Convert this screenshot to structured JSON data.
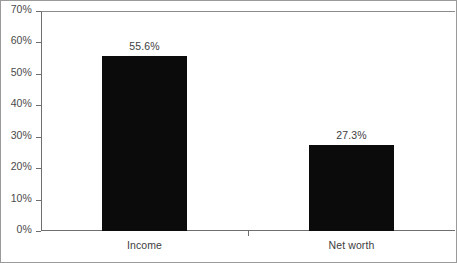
{
  "chart_data": {
    "type": "bar",
    "title": "",
    "subtitle": "",
    "xlabel": "",
    "ylabel": "",
    "categories": [
      "Income",
      "Net worth"
    ],
    "values": [
      55.6,
      27.3
    ],
    "value_labels": [
      "55.6%",
      "27.3%"
    ],
    "ylim": [
      0,
      70
    ],
    "yticks": [
      0,
      10,
      20,
      30,
      40,
      50,
      60,
      70
    ],
    "ytick_labels": [
      "0%",
      "10%",
      "20%",
      "30%",
      "40%",
      "50%",
      "60%",
      "70%"
    ],
    "grid": false,
    "legend": false,
    "legend_position": "none",
    "series": [
      {
        "name": "",
        "values": [
          55.6,
          27.3
        ],
        "color": "#0b0b0b"
      }
    ],
    "colors": {
      "bar_fill": "#0b0b0b",
      "axis_line": "#6e6e6e",
      "frame_border": "#9a9a9a",
      "tick_label": "#4a4a4a",
      "category_label": "#3d3d3d",
      "value_label": "#3d3d3d",
      "background": "#ffffff"
    }
  }
}
